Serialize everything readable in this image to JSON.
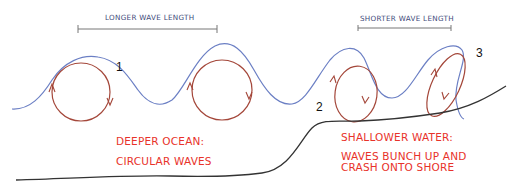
{
  "diagram": {
    "scale_bars": {
      "longer": {
        "label": "LONGER WAVE LENGTH"
      },
      "shorter": {
        "label": "SHORTER WAVE LENGTH"
      }
    },
    "markers": [
      {
        "id": "1",
        "label": "1"
      },
      {
        "id": "2",
        "label": "2"
      },
      {
        "id": "3",
        "label": "3"
      }
    ],
    "zones": {
      "deep": {
        "line1": "DEEPER OCEAN:",
        "line2": "CIRCULAR WAVES"
      },
      "shallow": {
        "line1": "SHALLOWER WATER:",
        "line2": "WAVES BUNCH UP AND",
        "line3": "CRASH ONTO SHORE"
      }
    },
    "colors": {
      "wave_surface": "#6b7fc4",
      "orbit": "#a4473a",
      "seafloor": "#333333",
      "zone_text": "#e8322a",
      "scale_text": "#3e4a7a",
      "scale_bar": "#777777"
    }
  }
}
